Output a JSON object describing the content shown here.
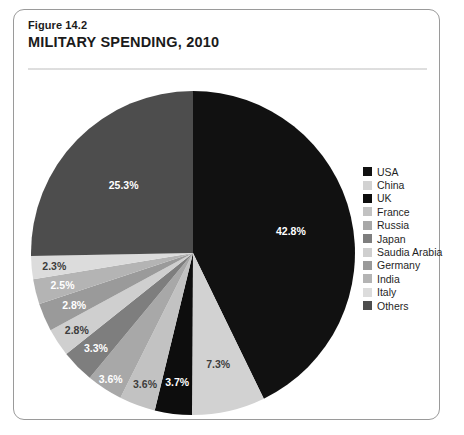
{
  "figure": {
    "number": "Figure 14.2",
    "title": "MILITARY SPENDING, 2010"
  },
  "chart_data": {
    "type": "pie",
    "title": "MILITARY SPENDING, 2010",
    "subtitle": "Figure 14.2",
    "value_unit": "percent",
    "start_angle_deg": 0,
    "direction": "clockwise",
    "legend_position": "right",
    "grid": false,
    "categories": [
      "USA",
      "China",
      "UK",
      "France",
      "Russia",
      "Japan",
      "Saudia Arabia",
      "Germany",
      "India",
      "Italy",
      "Others"
    ],
    "values": [
      42.8,
      7.3,
      3.7,
      3.6,
      3.6,
      3.3,
      2.8,
      2.8,
      2.5,
      2.3,
      25.3
    ],
    "labels": [
      "42.8%",
      "7.3%",
      "3.7%",
      "3.6%",
      "3.6%",
      "3.3%",
      "2.8%",
      "2.8%",
      "2.5%",
      "2.3%",
      "25.3%"
    ],
    "colors": [
      "#111111",
      "#d2d2d2",
      "#0d0d0d",
      "#c2c2c2",
      "#a8a8a8",
      "#7e7e7e",
      "#cfcfcf",
      "#9a9a9a",
      "#b4b4b4",
      "#dcdcdc",
      "#4d4d4d"
    ],
    "label_text_tone": [
      "on-dark",
      "on-pale",
      "on-dark",
      "on-pale",
      "on-light",
      "on-light",
      "on-pale",
      "on-light",
      "on-light",
      "on-pale",
      "on-dark"
    ],
    "slices": [
      {
        "name": "USA",
        "value": 42.8,
        "label": "42.8%",
        "color": "#111111"
      },
      {
        "name": "China",
        "value": 7.3,
        "label": "7.3%",
        "color": "#d2d2d2"
      },
      {
        "name": "UK",
        "value": 3.7,
        "label": "3.7%",
        "color": "#0d0d0d"
      },
      {
        "name": "France",
        "value": 3.6,
        "label": "3.6%",
        "color": "#c2c2c2"
      },
      {
        "name": "Russia",
        "value": 3.6,
        "label": "3.6%",
        "color": "#a8a8a8"
      },
      {
        "name": "Japan",
        "value": 3.3,
        "label": "3.3%",
        "color": "#7e7e7e"
      },
      {
        "name": "Saudia Arabia",
        "value": 2.8,
        "label": "2.8%",
        "color": "#cfcfcf"
      },
      {
        "name": "Germany",
        "value": 2.8,
        "label": "2.8%",
        "color": "#9a9a9a"
      },
      {
        "name": "India",
        "value": 2.5,
        "label": "2.5%",
        "color": "#b4b4b4"
      },
      {
        "name": "Italy",
        "value": 2.3,
        "label": "2.3%",
        "color": "#dcdcdc"
      },
      {
        "name": "Others",
        "value": 25.3,
        "label": "25.3%",
        "color": "#4d4d4d"
      }
    ]
  },
  "legend": {
    "items": [
      {
        "label": "USA",
        "color": "#111111"
      },
      {
        "label": "China",
        "color": "#d2d2d2"
      },
      {
        "label": "UK",
        "color": "#0d0d0d"
      },
      {
        "label": "France",
        "color": "#c2c2c2"
      },
      {
        "label": "Russia",
        "color": "#a8a8a8"
      },
      {
        "label": "Japan",
        "color": "#7e7e7e"
      },
      {
        "label": "Saudia Arabia",
        "color": "#cfcfcf"
      },
      {
        "label": "Germany",
        "color": "#9a9a9a"
      },
      {
        "label": "India",
        "color": "#b4b4b4"
      },
      {
        "label": "Italy",
        "color": "#dcdcdc"
      },
      {
        "label": "Others",
        "color": "#4d4d4d"
      }
    ]
  },
  "style": {
    "frame_border": "#9a9a9a",
    "background": "#ffffff",
    "text": "#1b1b1b"
  }
}
